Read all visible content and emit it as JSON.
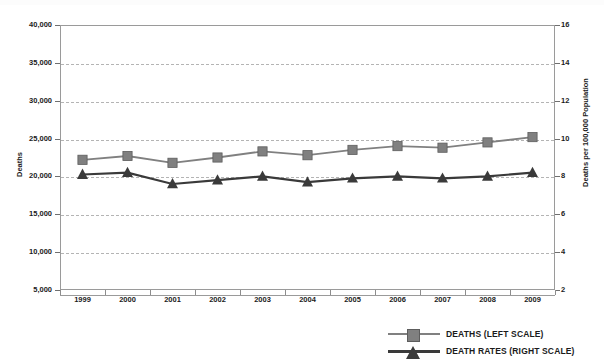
{
  "chart_data": {
    "type": "line",
    "title": "",
    "xlabel": "",
    "ylabel": "Deaths",
    "ylabel_right": "Deaths per 100,000 Population",
    "categories": [
      "1999",
      "2000",
      "2001",
      "2002",
      "2003",
      "2004",
      "2005",
      "2006",
      "2007",
      "2008",
      "2009"
    ],
    "grid": true,
    "legend_position": "bottom-right",
    "axes": {
      "left": {
        "label": "Deaths",
        "min": 5000,
        "max": 40000,
        "step": 5000,
        "ticks": [
          "5,000",
          "10,000",
          "15,000",
          "20,000",
          "25,000",
          "30,000",
          "35,000",
          "40,000"
        ],
        "tick_values": [
          5000,
          10000,
          15000,
          20000,
          25000,
          30000,
          35000,
          40000
        ]
      },
      "right": {
        "label": "Deaths per 100,000 Population",
        "min": 2,
        "max": 16,
        "step": 2,
        "ticks": [
          "2",
          "4",
          "6",
          "8",
          "10",
          "12",
          "14",
          "16"
        ],
        "tick_values": [
          2,
          4,
          6,
          8,
          10,
          12,
          14,
          16
        ]
      }
    },
    "series": [
      {
        "name": "DEATHS (LEFT SCALE)",
        "axis": "left",
        "marker": "square",
        "color": "#808080",
        "values": [
          22200,
          22700,
          21800,
          22500,
          23300,
          22800,
          23500,
          24000,
          23800,
          24500,
          25200
        ]
      },
      {
        "name": "DEATH RATES (RIGHT SCALE)",
        "axis": "right",
        "marker": "triangle",
        "color": "#3a3a3a",
        "values": [
          8.1,
          8.2,
          7.6,
          7.8,
          8.0,
          7.7,
          7.9,
          8.0,
          7.9,
          8.0,
          8.2
        ]
      }
    ]
  },
  "legend": {
    "items": [
      {
        "label": "DEATHS (LEFT SCALE)",
        "marker": "square",
        "color": "#808080"
      },
      {
        "label": "DEATH RATES (RIGHT SCALE)",
        "marker": "triangle",
        "color": "#3a3a3a"
      }
    ]
  },
  "colors": {
    "deaths_series": "#808080",
    "death_rates_series": "#3a3a3a",
    "gridline": "#b4b4b4",
    "axis": "#9a9a9a",
    "text": "#1b1b1b",
    "background": "#ffffff"
  }
}
